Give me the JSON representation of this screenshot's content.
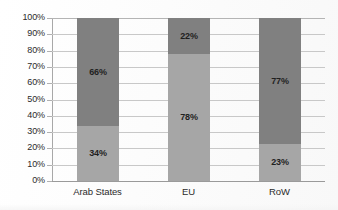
{
  "chart_data": {
    "type": "bar",
    "stacked": true,
    "normalized_100": true,
    "title": "",
    "subtitle": "",
    "xlabel": "",
    "ylabel": "",
    "categories": [
      "Arab States",
      "EU",
      "RoW"
    ],
    "series": [
      {
        "name": "lower-segment",
        "color": "#a6a6a6",
        "values": [
          34,
          78,
          23
        ],
        "labels": [
          "34%",
          "78%",
          "23%"
        ]
      },
      {
        "name": "upper-segment",
        "color": "#808080",
        "values": [
          66,
          22,
          77
        ],
        "labels": [
          "66%",
          "22%",
          "77%"
        ]
      }
    ],
    "ylim": [
      0,
      100
    ],
    "ytick_values": [
      0,
      10,
      20,
      30,
      40,
      50,
      60,
      70,
      80,
      90,
      100
    ],
    "ytick_labels": [
      "0%",
      "10%",
      "20%",
      "30%",
      "40%",
      "50%",
      "60%",
      "70%",
      "80%",
      "90%",
      "100%"
    ],
    "grid": true,
    "grid_axis": "y",
    "legend": false,
    "legend_position": "none",
    "annotations": []
  },
  "colors": {
    "lower_segment": "#a6a6a6",
    "upper_segment": "#808080",
    "gridline": "#c8c8c8",
    "axis": "#a8a8a8",
    "text": "#2b2b2b",
    "background": "#fefefe"
  }
}
